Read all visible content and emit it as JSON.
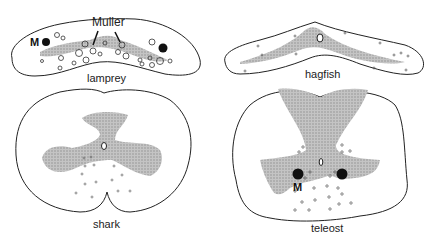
{
  "figure": {
    "panels": [
      {
        "id": "lamprey",
        "label": "lamprey",
        "annotations": [
          "Muller",
          "M"
        ]
      },
      {
        "id": "hagfish",
        "label": "hagfish",
        "annotations": []
      },
      {
        "id": "shark",
        "label": "shark",
        "annotations": []
      },
      {
        "id": "teleost",
        "label": "teleost",
        "annotations": [
          "M"
        ]
      }
    ]
  },
  "colors": {
    "outline": "#222222",
    "grey_matter": "#b8b8b8",
    "background": "#ffffff",
    "mauthner": "#111111"
  }
}
